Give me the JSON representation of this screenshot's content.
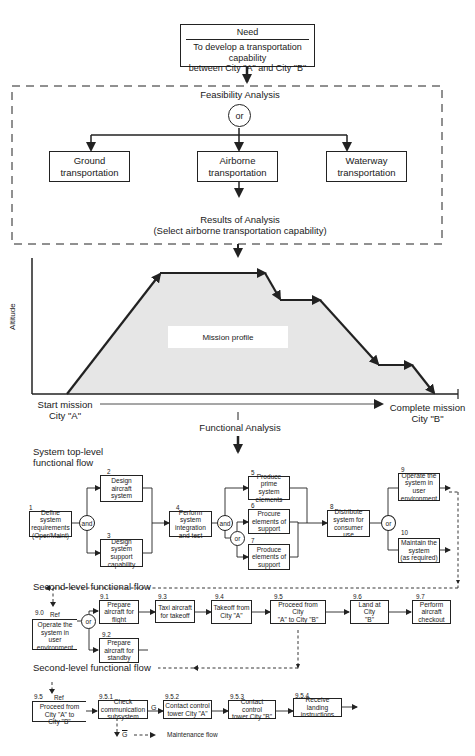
{
  "need": {
    "title": "Need",
    "description": "To develop a transportation capability\nbetween City \"A\" and City \"B\""
  },
  "feasibility": {
    "title": "Feasibility Analysis",
    "gate": "or",
    "options": [
      {
        "label": "Ground\ntransportation"
      },
      {
        "label": "Airborne\ntransportation"
      },
      {
        "label": "Waterway\ntransportation"
      }
    ],
    "results": "Results of Analysis\n(Select airborne transportation capability)"
  },
  "mission_profile": {
    "y_axis_label": "Altitude",
    "label": "Mission profile",
    "start_label": "Start mission\nCity \"A\"",
    "end_label": "Complete mission\nCity \"B\"",
    "fill_color": "#e6e6e6"
  },
  "functional_analysis": {
    "title": "Functional Analysis"
  },
  "top_level": {
    "title": "System top-level\nfunctional flow",
    "blocks": [
      {
        "num": "1",
        "label": "Define\nsystem\nrequirements\n(Oper/Maint)"
      },
      {
        "num": "2",
        "label": "Design\naircraft\nsystem"
      },
      {
        "num": "3",
        "label": "Design\nsystem\nsupport\ncapability"
      },
      {
        "num": "4",
        "label": "Perform\nsystem\nintegration\nand test"
      },
      {
        "num": "5",
        "label": "Produce\nprime system\nelements"
      },
      {
        "num": "6",
        "label": "Procure\nelements of\nsupport"
      },
      {
        "num": "7",
        "label": "Produce\nelements of\nsupport"
      },
      {
        "num": "8",
        "label": "Distribute\nsystem for\nconsumer\nuse"
      },
      {
        "num": "9",
        "label": "Operate the\nsystem in\nuser\nenvironment"
      },
      {
        "num": "10",
        "label": "Maintain the\nsystem\n(as required)"
      }
    ],
    "gates": {
      "and1": "and",
      "and2": "or_and",
      "or1": "or",
      "or2": "or"
    }
  },
  "second_level_a": {
    "title": "Second-level functional flow",
    "ref": {
      "num": "9.0",
      "tag": "Ref",
      "label": "Operate the\nsystem in\nuser\nenvironment"
    },
    "gate": "or",
    "blocks": [
      {
        "num": "9.1",
        "label": "Prepare\naircraft for\nflight"
      },
      {
        "num": "9.2",
        "label": "Prepare\naircraft for\nstandby"
      },
      {
        "num": "9.3",
        "label": "Taxi aircraft\nfor takeoff"
      },
      {
        "num": "9.4",
        "label": "Takeoff from\nCity \"A\""
      },
      {
        "num": "9.5",
        "label": "Proceed from City\n\"A\" to City \"B\""
      },
      {
        "num": "9.6",
        "label": "Land at City\n\"B\""
      },
      {
        "num": "9.7",
        "label": "Perform\naircraft\ncheckout"
      }
    ]
  },
  "second_level_b": {
    "title": "Second-level functional flow",
    "ref": {
      "num": "9.5",
      "tag": "Ref",
      "label": "Proceed from\nCity \"A\" to\nCity \"B\""
    },
    "blocks": [
      {
        "num": "9.5.1",
        "label": "Check\ncommunication\nsubsystem"
      },
      {
        "num": "9.5.2",
        "label": "Contact control\ntower City \"A\""
      },
      {
        "num": "9.5.3",
        "label": "Contact control\ntower City \"B\""
      },
      {
        "num": "9.5.4",
        "label": "Receive landing\ninstructions"
      }
    ],
    "go_label": "G",
    "nogo_label": "G",
    "legend": "Maintenance flow"
  }
}
